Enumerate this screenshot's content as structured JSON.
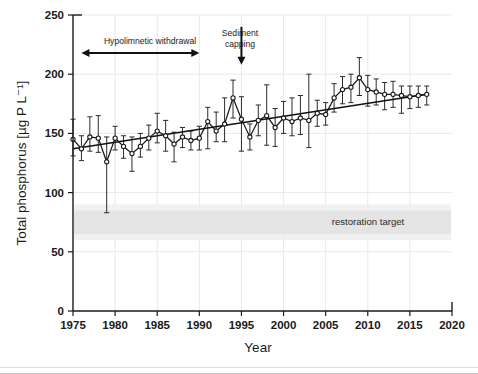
{
  "figure": {
    "title": "",
    "xlabel": "Year",
    "ylabel": "Total phosphorus [µg P L⁻¹]"
  },
  "annotations": {
    "hypolimnetic": "Hypolimnetic withdrawal",
    "sediment_line1": "Sediment",
    "sediment_line2": "capping",
    "restoration": "restoration target"
  },
  "axes": {
    "x_ticks": [
      "1975",
      "1980",
      "1985",
      "1990",
      "1995",
      "2000",
      "2005",
      "2010",
      "2015",
      "2020"
    ],
    "y_ticks": [
      "0",
      "50",
      "100",
      "150",
      "200",
      "250"
    ]
  },
  "chart_data": {
    "type": "line",
    "title": "",
    "xlabel": "Year",
    "ylabel": "Total phosphorus [µg P L⁻¹]",
    "xlim": [
      1975,
      2020
    ],
    "ylim": [
      0,
      250
    ],
    "xticks": [
      1975,
      1980,
      1985,
      1990,
      1995,
      2000,
      2005,
      2010,
      2015,
      2020
    ],
    "yticks": [
      0,
      50,
      100,
      150,
      200,
      250
    ],
    "grid": true,
    "legend": false,
    "marker": "open-circle",
    "error_bars": true,
    "x": [
      1975,
      1976,
      1977,
      1978,
      1979,
      1980,
      1981,
      1982,
      1983,
      1984,
      1985,
      1986,
      1987,
      1988,
      1989,
      1990,
      1991,
      1992,
      1993,
      1994,
      1995,
      1996,
      1997,
      1998,
      1999,
      2000,
      2001,
      2002,
      2003,
      2004,
      2005,
      2006,
      2007,
      2008,
      2009,
      2010,
      2011,
      2012,
      2013,
      2014,
      2015,
      2016,
      2017
    ],
    "series": [
      {
        "name": "Total phosphorus (annual mean)",
        "values": [
          145,
          137,
          147,
          146,
          126,
          146,
          139,
          133,
          139,
          146,
          152,
          148,
          141,
          147,
          144,
          146,
          160,
          152,
          158,
          180,
          162,
          147,
          161,
          165,
          155,
          163,
          160,
          163,
          161,
          167,
          166,
          180,
          187,
          189,
          197,
          187,
          185,
          183,
          183,
          182,
          181,
          182,
          183
        ],
        "err_low": [
          131,
          127,
          135,
          134,
          83,
          136,
          129,
          118,
          130,
          136,
          142,
          135,
          126,
          138,
          136,
          136,
          137,
          143,
          143,
          163,
          135,
          136,
          148,
          140,
          139,
          150,
          148,
          149,
          138,
          156,
          157,
          168,
          175,
          176,
          182,
          173,
          174,
          170,
          172,
          167,
          171,
          172,
          174
        ],
        "err_high": [
          162,
          148,
          164,
          165,
          147,
          156,
          148,
          147,
          150,
          157,
          167,
          161,
          151,
          155,
          152,
          156,
          172,
          168,
          180,
          195,
          181,
          158,
          174,
          191,
          171,
          177,
          180,
          182,
          200,
          178,
          176,
          192,
          198,
          200,
          214,
          199,
          196,
          193,
          194,
          190,
          190,
          190,
          190
        ]
      },
      {
        "name": "Linear trend",
        "type": "line",
        "x": [
          1975,
          2017
        ],
        "values": [
          137,
          183
        ]
      }
    ],
    "shaded_bands": [
      {
        "label": "restoration target",
        "y_min": 65,
        "y_max": 85,
        "color": "#e2e2e2"
      }
    ],
    "annotations": [
      {
        "text": "Hypolimnetic withdrawal",
        "type": "double-arrow",
        "x_start": 1976,
        "x_end": 1990,
        "y": 218
      },
      {
        "text": "Sediment capping",
        "type": "down-arrow",
        "x": 1995,
        "y_from": 240,
        "y_to": 208
      }
    ]
  }
}
